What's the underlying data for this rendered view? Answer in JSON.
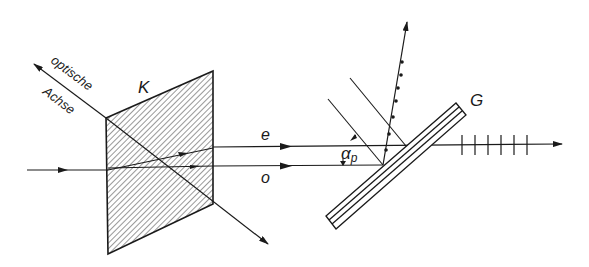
{
  "figure": {
    "labels": {
      "crystal": "K",
      "optic_axis_line1": "optische",
      "optic_axis_line2": "Achse",
      "extraordinary_ray": "e",
      "ordinary_ray": "o",
      "brewster_angle": "α",
      "brewster_angle_sub": "p",
      "glass_plate": "G"
    },
    "colors": {
      "line": "#1a1a1a",
      "hatch": "#333333",
      "background": "#ffffff"
    }
  }
}
